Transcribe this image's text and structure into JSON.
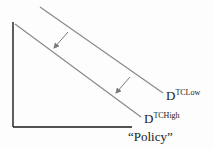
{
  "diagram": {
    "type": "demand-curve-shift",
    "x_axis_label": "“Policy”",
    "curves": [
      {
        "name": "D",
        "superscript": "TCLow",
        "position": "outer"
      },
      {
        "name": "D",
        "superscript": "TCHigh",
        "position": "inner"
      }
    ],
    "shift_arrows": 2,
    "shift_direction": "down-left",
    "line_color": "#8a8a8a",
    "axis_color": "#1a1a1a"
  }
}
